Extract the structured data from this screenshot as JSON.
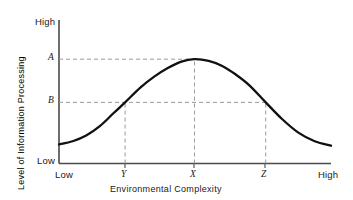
{
  "chart_data": {
    "type": "line",
    "title": "",
    "xlabel": "Environmental Complexity",
    "ylabel": "Level of Information Processing",
    "xlim": [
      0,
      100
    ],
    "ylim": [
      0,
      100
    ],
    "grid": false,
    "legend": null,
    "x_tick_labels": [
      "Low",
      "Y",
      "X",
      "Z",
      "High"
    ],
    "x_tick_values": [
      0,
      24.3,
      49.8,
      76.0,
      100
    ],
    "y_tick_labels": [
      "Low",
      "B",
      "A",
      "High"
    ],
    "y_tick_values": [
      0,
      42.6,
      72.7,
      100
    ],
    "series": [
      {
        "name": "Information processing curve",
        "x": [
          0,
          5,
          10,
          15,
          20,
          24.3,
          30,
          35,
          40,
          45,
          49.8,
          55,
          60,
          65,
          70,
          76,
          82,
          88,
          94,
          100
        ],
        "y": [
          13.3,
          15.5,
          19.5,
          26.0,
          35.0,
          42.6,
          53.0,
          60.5,
          66.5,
          71.0,
          72.7,
          71.5,
          68.0,
          62.0,
          54.5,
          42.6,
          31.0,
          21.5,
          15.5,
          12.4
        ]
      }
    ],
    "annotations": [
      {
        "name": "peak-point",
        "label": "A",
        "x": 49.8,
        "y": 72.7,
        "note": "Maximum level of information processing at complexity X"
      },
      {
        "name": "left-threshold",
        "label": "B",
        "x": 24.3,
        "y": 42.6,
        "note": "Level B reached at complexity Y"
      },
      {
        "name": "right-threshold",
        "label": "B",
        "x": 76.0,
        "y": 42.6,
        "note": "Level B reached again at complexity Z"
      }
    ],
    "guide_lines": [
      {
        "name": "guide-a-horizontal",
        "orientation": "horizontal",
        "value": 72.7,
        "style": "dashed",
        "from": 0,
        "to": 49.8
      },
      {
        "name": "guide-b-horizontal",
        "orientation": "horizontal",
        "value": 42.6,
        "style": "dashed",
        "from": 0,
        "to": 76.0
      },
      {
        "name": "guide-x-vertical",
        "orientation": "vertical",
        "value": 49.8,
        "style": "dashed",
        "from": 0,
        "to": 72.7
      },
      {
        "name": "guide-y-vertical",
        "orientation": "vertical",
        "value": 24.3,
        "style": "dashed",
        "from": 0,
        "to": 42.6
      },
      {
        "name": "guide-z-vertical",
        "orientation": "vertical",
        "value": 76.0,
        "style": "dashed",
        "from": 0,
        "to": 42.6
      }
    ],
    "colors": {
      "curve": "#111111",
      "axis": "#4a4a4a",
      "guides": "#9a9a9a",
      "text": "#1a1a1a",
      "background": "#ffffff"
    }
  },
  "axes": {
    "y_high_label": "High",
    "y_low_label": "Low",
    "y_level_a": "A",
    "y_level_b": "B",
    "x_low_label": "Low",
    "x_tick_y": "Y",
    "x_tick_x": "X",
    "x_tick_z": "Z",
    "x_high_label": "High",
    "x_axis_title": "Environmental Complexity",
    "y_axis_title": "Level of Information Processing"
  }
}
